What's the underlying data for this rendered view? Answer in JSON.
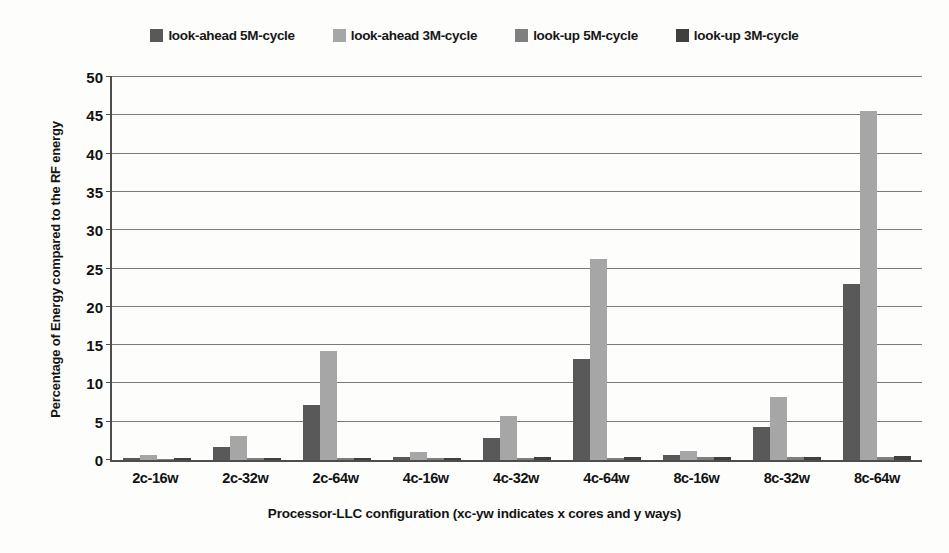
{
  "chart_data": {
    "type": "bar",
    "title": "",
    "xlabel": "Processor-LLC configuration  (xc-yw indicates x cores and y ways)",
    "ylabel": "Percentage of Energy compared to the RF energy",
    "categories": [
      "2c-16w",
      "2c-32w",
      "2c-64w",
      "4c-16w",
      "4c-32w",
      "4c-64w",
      "8c-16w",
      "8c-32w",
      "8c-64w"
    ],
    "ylim": [
      0,
      50
    ],
    "yticks": [
      0,
      5,
      10,
      15,
      20,
      25,
      30,
      35,
      40,
      45,
      50
    ],
    "grid": true,
    "legend_position": "top-center",
    "series": [
      {
        "name": "look-ahead 5M-cycle",
        "color": "#595959",
        "values": [
          0.2,
          1.7,
          7.2,
          0.4,
          2.9,
          13.2,
          0.6,
          4.3,
          23.0
        ]
      },
      {
        "name": "look-ahead 3M-cycle",
        "color": "#a6a6a6",
        "values": [
          0.6,
          3.2,
          14.2,
          1.0,
          5.7,
          26.3,
          1.2,
          8.2,
          45.6
        ]
      },
      {
        "name": "look-up 5M-cycle",
        "color": "#7f7f7f",
        "values": [
          0.15,
          0.2,
          0.25,
          0.2,
          0.3,
          0.3,
          0.35,
          0.4,
          0.45
        ]
      },
      {
        "name": "look-up 3M-cycle",
        "color": "#404040",
        "values": [
          0.2,
          0.25,
          0.3,
          0.25,
          0.35,
          0.4,
          0.4,
          0.45,
          0.5
        ]
      }
    ]
  },
  "legend": {
    "items": [
      {
        "label": "look-ahead 5M-cycle",
        "color": "#595959"
      },
      {
        "label": "look-ahead 3M-cycle",
        "color": "#a6a6a6"
      },
      {
        "label": "look-up 5M-cycle",
        "color": "#7f7f7f"
      },
      {
        "label": "look-up 3M-cycle",
        "color": "#404040"
      }
    ]
  },
  "axes": {
    "y_title": "Percentage of Energy compared to the RF energy",
    "x_title": "Processor-LLC configuration  (xc-yw indicates x cores and y ways)"
  }
}
